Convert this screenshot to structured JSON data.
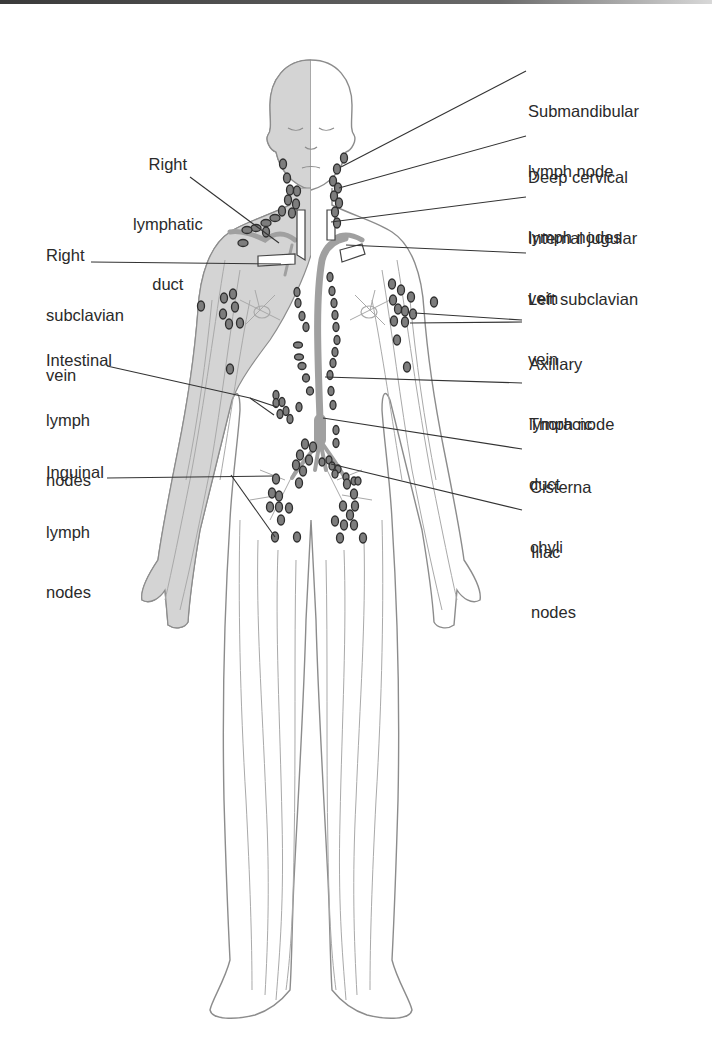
{
  "figure": {
    "colors": {
      "shaded_half": "#d4d4d4",
      "outline": "#8c8c8c",
      "vessel": "#a9a9a9",
      "node_fill": "#7d7d7d",
      "node_stroke": "#2e2e2e",
      "leader": "#333333",
      "text": "#2a2a2a"
    }
  },
  "labels": {
    "right_lymphatic_duct": {
      "l1": "Right",
      "l2": "lymphatic",
      "l3": "duct"
    },
    "right_subclavian_vein": {
      "l1": "Right",
      "l2": "subclavian",
      "l3": "vein"
    },
    "intestinal_lymph_nodes": {
      "l1": "Intestinal",
      "l2": "lymph",
      "l3": "nodes"
    },
    "inguinal_lymph_nodes": {
      "l1": "Inguinal",
      "l2": "lymph",
      "l3": "nodes"
    },
    "submandibular_lymph_node": {
      "l1": "Submandibular",
      "l2": "lymph node"
    },
    "deep_cervical_lymph_nodes": {
      "l1": "Deep cervical",
      "l2": "lymph nodes"
    },
    "internal_jugular_vein": {
      "l1": "Internal jugular",
      "l2": "vein"
    },
    "left_subclavian_vein": {
      "l1": "Left subclavian",
      "l2": "vein"
    },
    "axillary_lymph_node": {
      "l1": "Axillary",
      "l2": "lymph node"
    },
    "thoracic_duct": {
      "l1": "Thoracic",
      "l2": "duct"
    },
    "cisterna_chyli": {
      "l1": "Cisterna",
      "l2": "chyli"
    },
    "iliac_nodes": {
      "l1": "Iliac",
      "l2": "nodes"
    }
  }
}
